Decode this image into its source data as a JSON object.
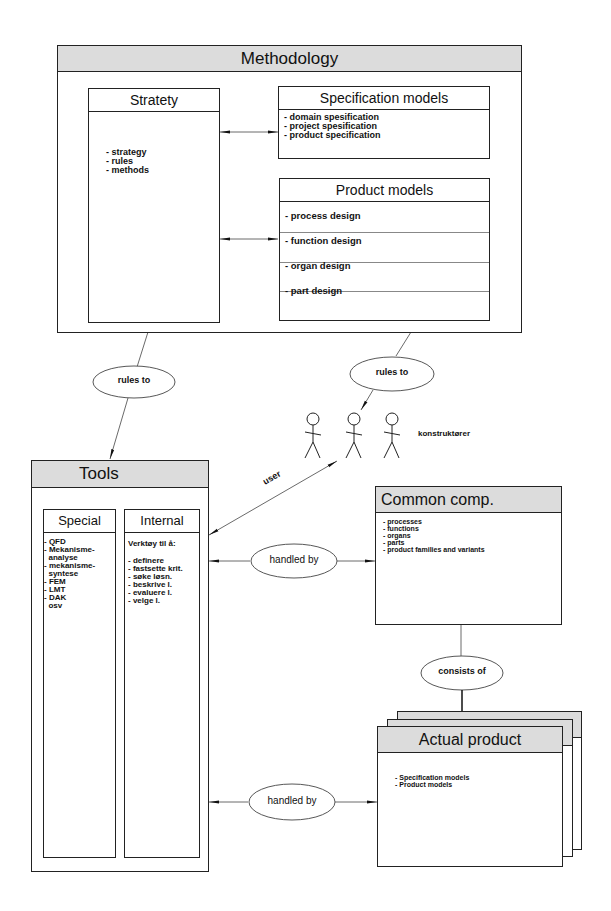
{
  "methodology": {
    "title": "Methodology",
    "strategy": {
      "title": "Stratety",
      "items": [
        "- strategy",
        "- rules",
        "- methods"
      ]
    },
    "specification_models": {
      "title": "Specification models",
      "items": [
        "- domain spesification",
        "- project spesification",
        "- product specification"
      ]
    },
    "product_models": {
      "title": "Product models",
      "items": [
        "- process design",
        "- function design",
        "- organ design",
        "- part design"
      ]
    }
  },
  "relations": {
    "rules_to_left": "rules to",
    "rules_to_right": "rules to",
    "user": "user",
    "handled_by_top": "handled by",
    "handled_by_bottom": "handled by",
    "consists_of": "consists of"
  },
  "actors": {
    "label": "konstruktører",
    "count": 3
  },
  "tools": {
    "title": "Tools",
    "special": {
      "title": "Special",
      "items": [
        "- QFD",
        "- Mekanisme-",
        "  analyse",
        "- mekanisme-",
        "  syntese",
        "- FEM",
        "- LMT",
        "- DAK",
        "  osv"
      ]
    },
    "internal": {
      "title": "Internal",
      "intro": "Verktøy til å:",
      "items": [
        "- definere",
        "- fastsette krit.",
        "- søke løsn.",
        "- beskrive l.",
        "- evaluere l.",
        "- velge l."
      ]
    }
  },
  "common_comp": {
    "title": "Common comp.",
    "items": [
      "- processes",
      "- functions",
      "- organs",
      "- parts",
      "- product families and variants"
    ]
  },
  "actual_product": {
    "title": "Actual product",
    "items": [
      "- Specification models",
      "- Product models"
    ]
  }
}
